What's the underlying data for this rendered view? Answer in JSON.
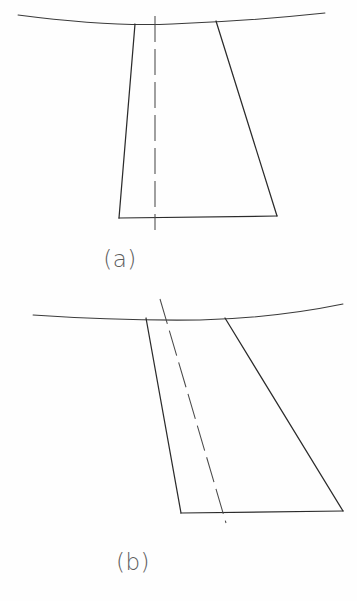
{
  "figure": {
    "background_color": "#fefefe",
    "ink_color": "#2b2b2b",
    "caption_color": "#5d5d5d",
    "panels": [
      {
        "id": "a",
        "caption": "(a)",
        "caption_position": {
          "x": 120,
          "y": 265
        },
        "description": "symmetric-trapezoid-with-vertical-centerline",
        "surface_curve": {
          "name": "surface-line",
          "path": "M 18 15 Q 110 27 172 24 Q 250 21 325 13",
          "x_start": 18,
          "x_end": 325
        },
        "outline": {
          "name": "trapezoid-outline",
          "top_left": {
            "x": 135,
            "y": 24
          },
          "top_right": {
            "x": 216,
            "y": 21
          },
          "bottom_right": {
            "x": 277,
            "y": 216
          },
          "bottom_left": {
            "x": 119,
            "y": 218
          }
        },
        "centerline": {
          "name": "vertical-centerline",
          "x1": 155,
          "y1": 16,
          "x2": 155,
          "y2": 230,
          "dash": "26 7",
          "inclined": false
        }
      },
      {
        "id": "b",
        "caption": "(b)",
        "caption_position": {
          "x": 133,
          "y": 568
        },
        "description": "skewed-trapezoid-with-inclined-centerline",
        "surface_curve": {
          "name": "surface-line",
          "path": "M 33 315 Q 120 321 200 320 Q 275 318 343 304",
          "x_start": 33,
          "x_end": 343
        },
        "outline": {
          "name": "trapezoid-outline",
          "top_left": {
            "x": 146,
            "y": 318
          },
          "top_right": {
            "x": 225,
            "y": 318
          },
          "bottom_right": {
            "x": 343,
            "y": 511
          },
          "bottom_left": {
            "x": 181,
            "y": 513
          }
        },
        "centerline": {
          "name": "inclined-centerline",
          "x1": 160,
          "y1": 299,
          "x2": 226,
          "y2": 523,
          "dash": "26 7",
          "inclined": true
        }
      }
    ]
  }
}
